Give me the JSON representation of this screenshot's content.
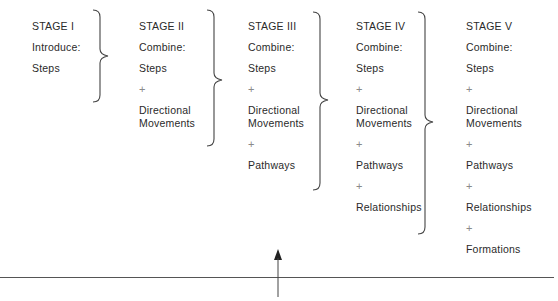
{
  "stages": [
    {
      "title": "STAGE I",
      "verb": "Introduce:",
      "items": [
        "Steps"
      ]
    },
    {
      "title": "STAGE II",
      "verb": "Combine:",
      "items": [
        "Steps",
        "+",
        "Directional",
        "Movements"
      ]
    },
    {
      "title": "STAGE III",
      "verb": "Combine:",
      "items": [
        "Steps",
        "+",
        "Directional",
        "Movements",
        "+",
        "Pathways"
      ]
    },
    {
      "title": "STAGE IV",
      "verb": "Combine:",
      "items": [
        "Steps",
        "+",
        "Directional",
        "Movements",
        "+",
        "Pathways",
        "+",
        "Relationships"
      ]
    },
    {
      "title": "STAGE V",
      "verb": "Combine:",
      "items": [
        "Steps",
        "+",
        "Directional",
        "Movements",
        "+",
        "Pathways",
        "+",
        "Relationships",
        "+",
        "Formations"
      ]
    }
  ],
  "connectors": {
    "brace_icon": "right-curly-brace",
    "arrow_icon": "up-arrow"
  }
}
